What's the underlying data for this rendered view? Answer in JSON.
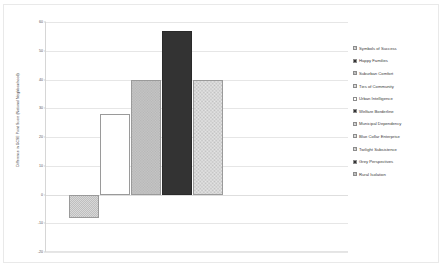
{
  "chart_data": {
    "type": "bar",
    "title": "",
    "xlabel": "",
    "ylabel": "Difference in GCSE Point Score (National Neighbourhood)",
    "ylim": [
      -20,
      60
    ],
    "yticks": [
      60,
      50,
      40,
      30,
      20,
      10,
      0,
      -10,
      -20
    ],
    "ytick_labels": [
      "60",
      "50",
      "40",
      "30",
      "20",
      "10",
      "0",
      "-10",
      "-20"
    ],
    "grid": true,
    "legend_position": "right",
    "categories": [
      "Symbols of Success",
      "Happy Families",
      "Suburban Comfort",
      "Ties of Community",
      "Urban Intelligence",
      "Welfare Borderline",
      "Municipal Dependency",
      "Blue Collar Enterprise",
      "Twilight Subsistence",
      "Grey Perspectives",
      "Rural Isolation"
    ],
    "bars": [
      {
        "label": "Symbols of Success",
        "value": -8,
        "fill": "checker-light"
      },
      {
        "label": "Happy Families",
        "value": 28,
        "fill": "hlines"
      },
      {
        "label": "Suburban Comfort",
        "value": 40,
        "fill": "grey-speckle"
      },
      {
        "label": "Ties of Community",
        "value": 57,
        "fill": "solid-dark"
      },
      {
        "label": "Urban Intelligence",
        "value": 40,
        "fill": "checker-fine"
      }
    ]
  },
  "legend": {
    "items": [
      {
        "label": "Symbols of Success",
        "fill": "checker-light"
      },
      {
        "label": "Happy Families",
        "fill": "solid-dark"
      },
      {
        "label": "Suburban Comfort",
        "fill": "grey-speckle"
      },
      {
        "label": "Ties of Community",
        "fill": "checker-fine"
      },
      {
        "label": "Urban Intelligence",
        "fill": "hlines"
      },
      {
        "label": "Welfare Borderline",
        "fill": "solid-dark"
      },
      {
        "label": "Municipal Dependency",
        "fill": "checker-light"
      },
      {
        "label": "Blue Collar Enterprise",
        "fill": "checker-fine"
      },
      {
        "label": "Twilight Subsistence",
        "fill": "checker-light"
      },
      {
        "label": "Grey Perspectives",
        "fill": "solid-dark"
      },
      {
        "label": "Rural Isolation",
        "fill": "grey-speckle"
      }
    ]
  },
  "colors": {
    "gridline": "#e6e6e6",
    "axis": "#d6d6d6",
    "text": "#3a3a3a",
    "bar_dark": "#333333",
    "bar_light": "#d8d8d8"
  }
}
